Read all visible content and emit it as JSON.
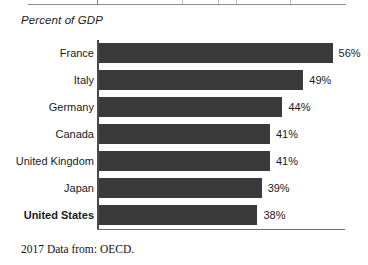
{
  "axis_title": "Percent of GDP",
  "footnote": "2017 Data from: OECD.",
  "colors": {
    "bar": "#3a3a3a",
    "axis": "#4a4a4a",
    "text": "#1a1a1a",
    "rule": "#8a8a8a"
  },
  "chart_data": {
    "type": "bar",
    "orientation": "horizontal",
    "title": "",
    "subtitle": "",
    "xlabel": "Percent of GDP",
    "ylabel": "",
    "categories": [
      "France",
      "Italy",
      "Germany",
      "Canada",
      "United Kingdom",
      "Japan",
      "United States"
    ],
    "values": [
      56,
      49,
      44,
      41,
      41,
      39,
      38
    ],
    "value_labels": [
      "56%",
      "49%",
      "44%",
      "41%",
      "41%",
      "39%",
      "38%"
    ],
    "highlighted_category": "United States",
    "xlim": [
      0,
      56
    ],
    "grid": false,
    "legend": null,
    "annotations": [
      "2017 Data from: OECD."
    ]
  },
  "bars": [
    {
      "label": "France",
      "value": 56,
      "value_label": "56%",
      "highlight": false
    },
    {
      "label": "Italy",
      "value": 49,
      "value_label": "49%",
      "highlight": false
    },
    {
      "label": "Germany",
      "value": 44,
      "value_label": "44%",
      "highlight": false
    },
    {
      "label": "Canada",
      "value": 41,
      "value_label": "41%",
      "highlight": false
    },
    {
      "label": "United Kingdom",
      "value": 41,
      "value_label": "41%",
      "highlight": false
    },
    {
      "label": "Japan",
      "value": 39,
      "value_label": "39%",
      "highlight": false
    },
    {
      "label": "United States",
      "value": 38,
      "value_label": "38%",
      "highlight": true
    }
  ]
}
